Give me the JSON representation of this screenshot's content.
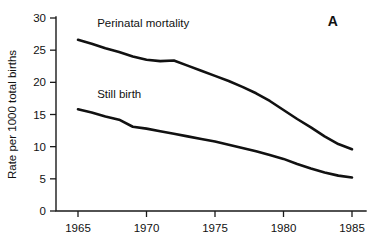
{
  "panel": {
    "label": "A"
  },
  "chart_data": {
    "type": "line",
    "title": "",
    "subtitle": "",
    "xlabel": "",
    "ylabel": "Rate per 1000 total births",
    "xlim": [
      1965,
      1985
    ],
    "ylim": [
      0,
      30
    ],
    "grid": false,
    "legend_position": "inline-annotation",
    "x_ticks": [
      1965,
      1970,
      1975,
      1980,
      1985
    ],
    "x_tick_labels": [
      "1965",
      "1970",
      "1975",
      "1980",
      "1985"
    ],
    "y_ticks": [
      0,
      5,
      10,
      15,
      20,
      25,
      30
    ],
    "y_tick_labels": [
      "0",
      "5",
      "10",
      "15",
      "20",
      "25",
      "30"
    ],
    "annotations": [
      {
        "text": "Perinatal mortality",
        "x": 1966.4,
        "y": 28.6
      },
      {
        "text": "Still birth",
        "x": 1966.4,
        "y": 17.6
      },
      {
        "text": "A",
        "x": 1983.6,
        "y": 28.8
      }
    ],
    "series": [
      {
        "name": "Perinatal mortality",
        "color": "#111111",
        "x": [
          1965,
          1966,
          1967,
          1968,
          1969,
          1970,
          1971,
          1972,
          1973,
          1974,
          1975,
          1976,
          1977,
          1978,
          1979,
          1980,
          1981,
          1982,
          1983,
          1984,
          1985
        ],
        "values": [
          26.6,
          26.0,
          25.3,
          24.7,
          24.0,
          23.5,
          23.3,
          23.4,
          22.6,
          21.8,
          21.0,
          20.2,
          19.3,
          18.3,
          17.1,
          15.7,
          14.3,
          13.0,
          11.6,
          10.4,
          9.6
        ]
      },
      {
        "name": "Still birth",
        "color": "#111111",
        "x": [
          1965,
          1966,
          1967,
          1968,
          1969,
          1970,
          1971,
          1972,
          1973,
          1974,
          1975,
          1976,
          1977,
          1978,
          1979,
          1980,
          1981,
          1982,
          1983,
          1984,
          1985
        ],
        "values": [
          15.8,
          15.3,
          14.7,
          14.2,
          13.1,
          12.8,
          12.4,
          12.0,
          11.6,
          11.2,
          10.8,
          10.3,
          9.8,
          9.3,
          8.7,
          8.1,
          7.3,
          6.6,
          6.0,
          5.5,
          5.2
        ]
      }
    ]
  }
}
